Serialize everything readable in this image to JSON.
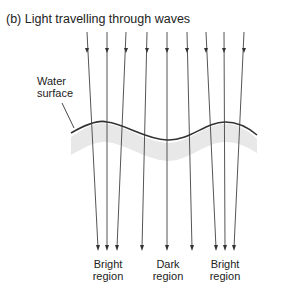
{
  "title": "(b)  Light travelling through waves",
  "labels": {
    "water_surface_line1": "Water",
    "water_surface_line2": "surface",
    "bright_left_line1": "Bright",
    "bright_left_line2": "region",
    "dark_line1": "Dark",
    "dark_line2": "region",
    "bright_right_line1": "Bright",
    "bright_right_line2": "region"
  },
  "colors": {
    "ray": "#555555",
    "surface": "#333333",
    "water_band": "#e6e6e6"
  },
  "rays": {
    "top_x": [
      87,
      107,
      126,
      147,
      167,
      187,
      206,
      224,
      244
    ],
    "bottom_x": [
      98,
      107,
      117,
      142,
      167,
      192,
      216,
      225,
      234
    ]
  }
}
